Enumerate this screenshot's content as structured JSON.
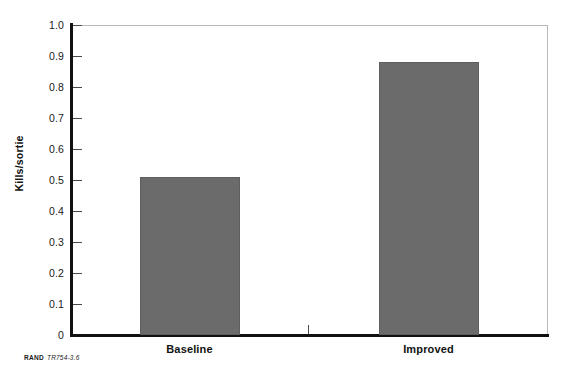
{
  "chart_data": {
    "type": "bar",
    "title": "",
    "subtitle": "",
    "xlabel": "",
    "ylabel": "Kills/sortie",
    "categories": [
      "Baseline",
      "Improved"
    ],
    "values": [
      0.51,
      0.88
    ],
    "series": [
      {
        "name": "Kills/sortie",
        "values": [
          0.51,
          0.88
        ]
      }
    ],
    "ylim": [
      0,
      1.0
    ],
    "ytick_values": [
      0,
      0.1,
      0.2,
      0.3,
      0.4,
      0.5,
      0.6,
      0.7,
      0.8,
      0.9,
      1.0
    ],
    "ytick_labels": [
      "0",
      "0.1",
      "0.2",
      "0.3",
      "0.4",
      "0.5",
      "0.6",
      "0.7",
      "0.8",
      "0.9",
      "1.0"
    ],
    "grid": false,
    "legend": false,
    "legend_position": "none",
    "bar_color": "#6b6b6b",
    "axis_color": "#111111",
    "frame_color": "#b9b9b9",
    "annotations": []
  },
  "footer": {
    "org": "RAND",
    "figure_code": "TR754-3.6"
  }
}
